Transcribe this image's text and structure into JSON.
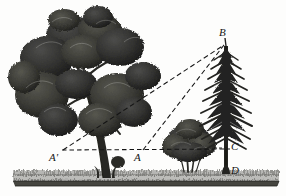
{
  "figure": {
    "kind": "engraving-illustration",
    "background_color": "#fdfdfc",
    "ink_color": "#1a1a1a",
    "width": 286,
    "height": 196
  },
  "labels": [
    {
      "id": "B",
      "text": "B",
      "x": 222,
      "y": 33,
      "meaning": "apex-of-fir-tree"
    },
    {
      "id": "A'",
      "text": "A'",
      "x": 56,
      "y": 158,
      "meaning": "far-observation-point"
    },
    {
      "id": "A",
      "text": "A",
      "x": 140,
      "y": 158,
      "meaning": "near-observation-point"
    },
    {
      "id": "C",
      "text": "C",
      "x": 234,
      "y": 147,
      "meaning": "eye-level-point-on-trunk"
    },
    {
      "id": "D",
      "text": "D",
      "x": 234,
      "y": 171,
      "meaning": "base-of-fir-tree"
    }
  ],
  "geometry": {
    "baseline": {
      "name": "horizontal-sight-line",
      "from": {
        "x": 62,
        "y": 150
      },
      "to": {
        "x": 230,
        "y": 149
      },
      "style": "dashed"
    },
    "sight_lines": [
      {
        "name": "sight-line-from-A-prime",
        "from": {
          "x": 63,
          "y": 150
        },
        "to": {
          "x": 224,
          "y": 45
        },
        "style": "dashed"
      },
      {
        "name": "sight-line-from-A",
        "from": {
          "x": 143,
          "y": 150
        },
        "to": {
          "x": 224,
          "y": 45
        },
        "style": "dashed"
      }
    ],
    "vertical": {
      "name": "fir-trunk-vertical-BCD",
      "from": {
        "x": 226,
        "y": 45
      },
      "to": {
        "x": 226,
        "y": 174
      }
    }
  },
  "scene": {
    "ground": {
      "name": "grassy-ground-strip",
      "left": 13,
      "right": 279,
      "top": 170,
      "bottom": 186,
      "base_color": "#4a4a48",
      "grass_color": "#6e6e6a"
    },
    "trees": [
      {
        "name": "large-oak-tree",
        "position": "left",
        "trunk_base_x": 108,
        "canopy_center_x": 78,
        "canopy_center_y": 72
      },
      {
        "name": "small-bush-tree",
        "position": "middle",
        "trunk_base_x": 190,
        "canopy_center_x": 190,
        "canopy_center_y": 143
      },
      {
        "name": "fir-tree",
        "position": "right",
        "trunk_base_x": 226,
        "apex_x": 224,
        "apex_y": 45
      }
    ]
  }
}
